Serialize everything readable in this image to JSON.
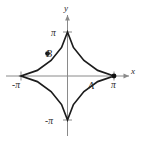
{
  "figure": {
    "kind": "math-plot",
    "background_color": "#ffffff",
    "axis_color": "#8a8a8a",
    "curve_color": "#1c1c1c",
    "label_color": "#2b2b2b",
    "axes": {
      "x_axis_label": "x",
      "y_axis_label": "y",
      "x_ticks": [
        {
          "label": "-π",
          "value": -3.14159,
          "position": "below-left-end"
        },
        {
          "label": "π",
          "value": 3.14159,
          "position": "below-right-end"
        }
      ],
      "y_ticks": [
        {
          "label": "π",
          "value": 3.14159,
          "position": "left-of-top"
        },
        {
          "label": "-π",
          "value": -3.14159,
          "position": "left-of-bottom"
        }
      ]
    },
    "points": [
      {
        "name": "A",
        "label": "A",
        "on_curve": "astroid",
        "location": "right cusp on x-axis",
        "x": 3.14159,
        "y": 0
      },
      {
        "name": "B",
        "label": "B",
        "on_curve": "astroid",
        "location": "upper-left arc",
        "x": -1.35,
        "y": 1.6
      }
    ],
    "curves": [
      {
        "name": "ellipse",
        "description": "outer ellipse enclosing the astroid",
        "semi_axis_x": 3.14159,
        "semi_axis_y": 1.78
      },
      {
        "name": "astroid",
        "description": "four-cusped hypocycloid with cusps at (±π,0) and (0,±π)",
        "cusp_radius": 3.14159
      }
    ]
  },
  "chart_data": {
    "type": "line",
    "title": "",
    "xlabel": "x",
    "ylabel": "y",
    "xlim": [
      -3.9,
      3.9
    ],
    "ylim": [
      -3.9,
      3.9
    ],
    "grid": false,
    "legend": "none",
    "xticks": [
      -3.14159,
      3.14159
    ],
    "xticklabels": [
      "-π",
      "π"
    ],
    "yticks": [
      -3.14159,
      3.14159
    ],
    "yticklabels": [
      "-π",
      "π"
    ],
    "series": [
      {
        "name": "ellipse",
        "kind": "closed-curve",
        "equation": "(x/π)^2 + (y/1.78)^2 = 1",
        "points": [
          [
            3.14159,
            0.0
          ],
          [
            2.72,
            0.89
          ],
          [
            1.57,
            1.54
          ],
          [
            0.0,
            1.78
          ],
          [
            -1.57,
            1.54
          ],
          [
            -2.72,
            0.89
          ],
          [
            -3.14159,
            0.0
          ],
          [
            -2.72,
            -0.89
          ],
          [
            -1.57,
            -1.54
          ],
          [
            0.0,
            -1.78
          ],
          [
            1.57,
            -1.54
          ],
          [
            2.72,
            -0.89
          ],
          [
            3.14159,
            0.0
          ]
        ]
      },
      {
        "name": "astroid",
        "kind": "closed-curve",
        "equation": "x^(2/3) + y^(2/3) = π^(2/3)",
        "points": [
          [
            3.14159,
            0.0
          ],
          [
            2.04,
            0.4
          ],
          [
            1.11,
            1.11
          ],
          [
            0.4,
            2.04
          ],
          [
            0.0,
            3.14159
          ],
          [
            -0.4,
            2.04
          ],
          [
            -1.11,
            1.11
          ],
          [
            -2.04,
            0.4
          ],
          [
            -3.14159,
            0.0
          ],
          [
            -2.04,
            -0.4
          ],
          [
            -1.11,
            -1.11
          ],
          [
            -0.4,
            -2.04
          ],
          [
            0.0,
            -3.14159
          ],
          [
            0.4,
            -2.04
          ],
          [
            1.11,
            -1.11
          ],
          [
            2.04,
            -0.4
          ],
          [
            3.14159,
            0.0
          ]
        ]
      }
    ],
    "annotations": [
      {
        "text": "A",
        "x": 3.14159,
        "y": 0,
        "marker": "filled-dot"
      },
      {
        "text": "B",
        "x": -1.35,
        "y": 1.6,
        "marker": "filled-dot"
      }
    ]
  }
}
